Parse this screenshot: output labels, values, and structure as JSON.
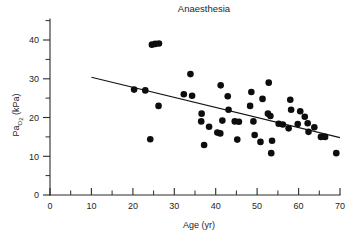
{
  "chart_data": {
    "type": "scatter",
    "title": "Anaesthesia",
    "xlabel": "Age (yr)",
    "ylabel": "Pa",
    "ylabel_sub": "O",
    "ylabel_sub2": "2",
    "ylabel_unit": " (kPa)",
    "ylabel_full": "PaO2 (kPa)",
    "xlim": [
      0,
      70
    ],
    "ylim": [
      0,
      45
    ],
    "xticks": [
      0,
      10,
      20,
      30,
      40,
      50,
      60,
      70
    ],
    "yticks": [
      0,
      10,
      20,
      30,
      40
    ],
    "xticks_minor": [
      5,
      15,
      25,
      35,
      45,
      55,
      65
    ],
    "yticks_minor": [
      5,
      15,
      25,
      35,
      45
    ],
    "grid": false,
    "legend": "none",
    "series": [
      {
        "name": "Arterial oxygen tension vs age",
        "marker": "filled-circle",
        "color": "#0d0d0d",
        "points": [
          [
            20.3,
            27.2
          ],
          [
            23.0,
            27.0
          ],
          [
            24.2,
            14.4
          ],
          [
            24.6,
            38.8
          ],
          [
            25.4,
            39.0
          ],
          [
            26.3,
            39.1
          ],
          [
            26.2,
            23.0
          ],
          [
            32.3,
            26.0
          ],
          [
            33.9,
            31.2
          ],
          [
            34.3,
            25.6
          ],
          [
            36.6,
            21.0
          ],
          [
            36.5,
            19.0
          ],
          [
            37.2,
            12.9
          ],
          [
            38.4,
            17.6
          ],
          [
            40.4,
            16.1
          ],
          [
            41.1,
            15.9
          ],
          [
            41.2,
            28.3
          ],
          [
            41.6,
            19.2
          ],
          [
            42.9,
            25.5
          ],
          [
            43.1,
            22.0
          ],
          [
            44.6,
            19.0
          ],
          [
            45.2,
            14.3
          ],
          [
            45.6,
            18.9
          ],
          [
            48.3,
            23.0
          ],
          [
            48.6,
            26.6
          ],
          [
            49.1,
            19.0
          ],
          [
            49.4,
            15.5
          ],
          [
            50.8,
            13.7
          ],
          [
            51.3,
            24.8
          ],
          [
            52.6,
            21.0
          ],
          [
            52.8,
            29.0
          ],
          [
            53.2,
            20.4
          ],
          [
            53.4,
            10.8
          ],
          [
            53.6,
            14.0
          ],
          [
            55.2,
            18.4
          ],
          [
            56.2,
            18.2
          ],
          [
            57.6,
            17.2
          ],
          [
            58.0,
            24.6
          ],
          [
            58.2,
            22.0
          ],
          [
            59.8,
            18.3
          ],
          [
            60.4,
            21.6
          ],
          [
            61.5,
            20.2
          ],
          [
            62.2,
            18.5
          ],
          [
            62.4,
            16.3
          ],
          [
            63.8,
            17.5
          ],
          [
            65.4,
            15.0
          ],
          [
            66.4,
            15.0
          ],
          [
            69.1,
            10.8
          ]
        ]
      }
    ],
    "fit_line": {
      "name": "linear regression",
      "x_start": 10,
      "y_start": 30.4,
      "x_end": 70,
      "y_end": 14.8
    }
  }
}
